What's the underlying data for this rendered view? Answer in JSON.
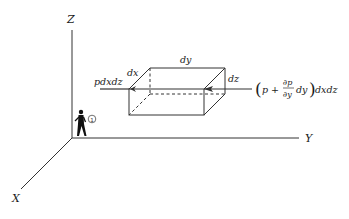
{
  "diagram": {
    "axes": {
      "z_label": "Z",
      "y_label": "Y",
      "x_label": "X"
    },
    "element": {
      "dx_label": "dx",
      "dy_label": "dy",
      "dz_label": "dz"
    },
    "forces": {
      "left_label": "pdxdz",
      "right_open": "(",
      "right_p": "p + ",
      "right_frac_num": "∂p",
      "right_frac_den": "∂y",
      "right_dy": "dy",
      "right_close": ")",
      "right_tail": "dxdz"
    },
    "observer": {
      "marker": "①"
    },
    "colors": {
      "line": "#333333",
      "background": "#ffffff"
    }
  }
}
